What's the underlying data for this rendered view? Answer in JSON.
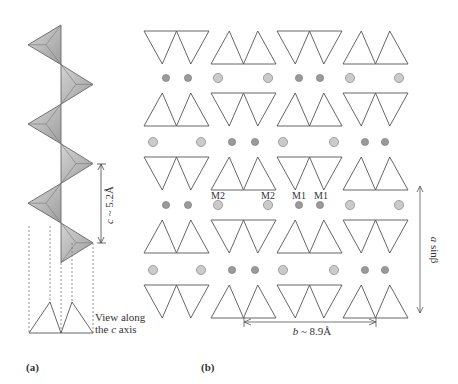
{
  "figure": {
    "panel_a": {
      "label": "(a)",
      "dimension_label": "c ~ 5.2Å",
      "dimension_var": "c",
      "dimension_value": "~ 5.2Å",
      "view_caption_line1": "View along",
      "view_caption_line2_prefix": "the ",
      "view_caption_line2_var": "c",
      "view_caption_line2_suffix": " axis",
      "chain": {
        "type": "zigzag chain of corner-sharing tetrahedra",
        "tetrahedra_count": 6,
        "tetra_fill": "#b9b9b9",
        "tetra_edge": "#666666"
      }
    },
    "panel_b": {
      "label": "(b)",
      "site_labels": [
        "M2",
        "M2",
        "M1",
        "M1"
      ],
      "b_dimension_var": "b",
      "b_dimension_value": "~ 8.9Å",
      "a_dimension_var": "a",
      "a_dimension_value": "sinβ",
      "rows": [
        {
          "orientation": [
            "down",
            "up",
            "down",
            "up"
          ]
        },
        {
          "orientation": [
            "up",
            "down",
            "up",
            "down"
          ]
        },
        {
          "orientation": [
            "down",
            "up",
            "down",
            "up"
          ]
        },
        {
          "orientation": [
            "up",
            "down",
            "up",
            "down"
          ]
        },
        {
          "orientation": [
            "down",
            "up",
            "down",
            "up"
          ]
        }
      ],
      "cation_rows": [
        {
          "pattern": [
            "M1",
            "M1",
            "M2",
            "M2",
            "M1",
            "M1",
            "M2",
            "M2"
          ]
        },
        {
          "pattern": [
            "M2",
            "M2",
            "M1",
            "M1",
            "M2",
            "M2",
            "M1",
            "M1"
          ]
        },
        {
          "pattern": [
            "M1",
            "M1",
            "M2",
            "M2",
            "M1",
            "M1",
            "M2",
            "M2"
          ]
        },
        {
          "pattern": [
            "M2",
            "M2",
            "M1",
            "M1",
            "M2",
            "M2",
            "M1",
            "M1"
          ]
        }
      ],
      "colors": {
        "m1_site": "#9a9a9a",
        "m2_site": "#cacaca",
        "line": "#555555"
      }
    }
  }
}
